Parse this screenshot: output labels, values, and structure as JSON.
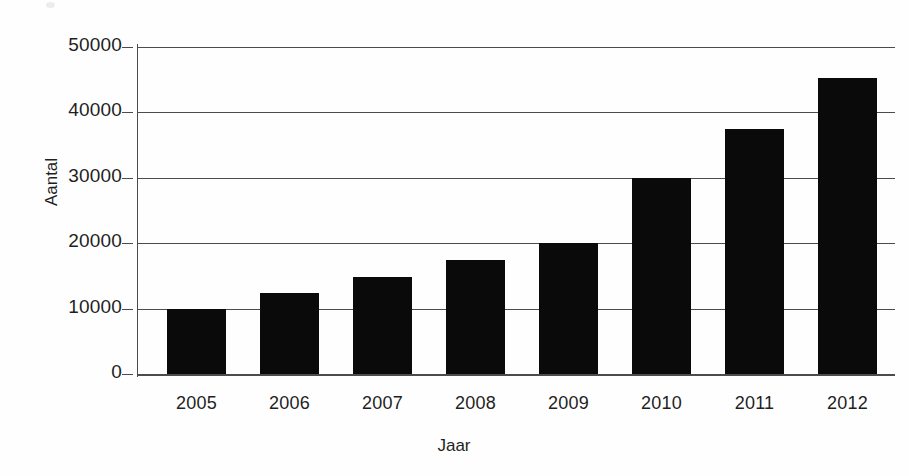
{
  "chart_data": {
    "type": "bar",
    "title": "",
    "xlabel": "Jaar",
    "ylabel": "Aantal",
    "categories": [
      "2005",
      "2006",
      "2007",
      "2008",
      "2009",
      "2010",
      "2011",
      "2012"
    ],
    "values": [
      10000,
      12400,
      14900,
      17400,
      20000,
      30000,
      37500,
      45200
    ],
    "ylim": [
      0,
      50000
    ],
    "yticks": [
      0,
      10000,
      20000,
      30000,
      40000,
      50000
    ],
    "ytick_labels": [
      "0",
      "10000",
      "20000",
      "30000",
      "40000",
      "50000"
    ],
    "grid": true,
    "legend": null,
    "bar_color": "#0a0a0a",
    "axis_color": "#4c4c4c",
    "background": "#ffffff"
  },
  "axes": {
    "y_title": "Aantal",
    "x_title": "Jaar"
  }
}
